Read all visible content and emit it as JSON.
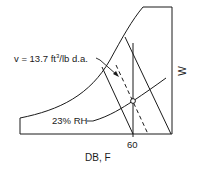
{
  "diagram": {
    "type": "psychrometric-chart-sketch",
    "volume_label_prefix": "v = 13.7 ft",
    "volume_label_sup": "3",
    "volume_label_suffix": "/lb d.a.",
    "rh_label": "23% RH",
    "x_tick_label": "60",
    "x_axis_label": "DB, F",
    "y_axis_label": "W",
    "colors": {
      "line": "#1a1a1a",
      "background": "#ffffff"
    }
  }
}
